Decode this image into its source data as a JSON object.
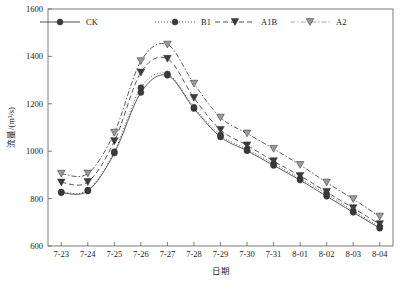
{
  "chart_data": {
    "type": "line",
    "title": "",
    "xlabel": "日期",
    "ylabel": "流量/(m³/s)",
    "ylim": [
      600,
      1600
    ],
    "yticks": [
      600,
      800,
      1000,
      1200,
      1400,
      1600
    ],
    "grid": false,
    "legend_position": "top",
    "categories": [
      "7-23",
      "7-24",
      "7-25",
      "7-26",
      "7-27",
      "7-28",
      "7-29",
      "7-30",
      "7-31",
      "8-01",
      "8-02",
      "8-03",
      "8-04"
    ],
    "series": [
      {
        "name": "CK",
        "marker": "circle",
        "line_style": "solid",
        "color": "#3c3c3c",
        "values": [
          825,
          832,
          992,
          1248,
          1320,
          1180,
          1060,
          1002,
          940,
          878,
          810,
          742,
          675
        ]
      },
      {
        "name": "B1",
        "marker": "circle",
        "line_style": "dotted",
        "color": "#3c3c3c",
        "values": [
          828,
          836,
          998,
          1268,
          1326,
          1185,
          1068,
          1008,
          948,
          884,
          820,
          748,
          682
        ]
      },
      {
        "name": "A1B",
        "marker": "triangle-down",
        "line_style": "dashed",
        "color": "#3c3c3c",
        "values": [
          868,
          870,
          1042,
          1332,
          1390,
          1225,
          1090,
          1025,
          958,
          896,
          828,
          760,
          692
        ]
      },
      {
        "name": "A2",
        "marker": "triangle-down",
        "line_style": "dashdot",
        "color": "#9a9a9a",
        "values": [
          905,
          906,
          1078,
          1380,
          1450,
          1285,
          1142,
          1075,
          1010,
          942,
          868,
          798,
          724
        ]
      }
    ]
  },
  "axis": {
    "y_tick_labels": [
      "1600",
      "1400",
      "1200",
      "1000",
      "800",
      "600"
    ],
    "x_tick_labels": [
      "7-23",
      "7-24",
      "7-25",
      "7-26",
      "7-27",
      "7-28",
      "7-29",
      "7-30",
      "7-31",
      "8-01",
      "8-02",
      "8-03",
      "8-04"
    ],
    "y_title": "流量/(m³/s)",
    "x_title": "日期"
  },
  "legend": {
    "items": [
      {
        "label": "CK",
        "marker": "circle",
        "line_style": "solid"
      },
      {
        "label": "B1",
        "marker": "circle",
        "line_style": "dotted"
      },
      {
        "label": "A1B",
        "marker": "triangle-down",
        "line_style": "dashed"
      },
      {
        "label": "A2",
        "marker": "triangle-down",
        "line_style": "dashdot"
      }
    ]
  }
}
